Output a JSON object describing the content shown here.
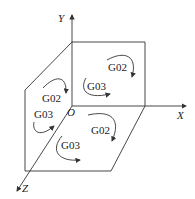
{
  "diagram": {
    "axes": {
      "x_label": "X",
      "y_label": "Y",
      "z_label": "Z",
      "origin_label": "O"
    },
    "planes": {
      "xy": {
        "upper": "G02",
        "lower": "G03"
      },
      "yz": {
        "upper": "G02",
        "lower": "G03"
      },
      "xz": {
        "upper": "G02",
        "lower": "G03"
      }
    },
    "colors": {
      "line": "#333333",
      "background": "#ffffff"
    }
  }
}
